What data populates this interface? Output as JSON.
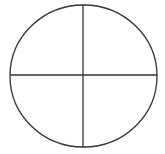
{
  "diagram": {
    "type": "circle-quadrants",
    "stroke_color": "#333333",
    "background_color": "#ffffff",
    "circle": {
      "cx": 83.5,
      "cy": 76,
      "rx": 73.5,
      "ry": 71
    },
    "vertical_line": {
      "x": 83,
      "y1": 5,
      "y2": 147
    },
    "horizontal_line": {
      "y": 75,
      "x1": 10,
      "x2": 157
    }
  }
}
